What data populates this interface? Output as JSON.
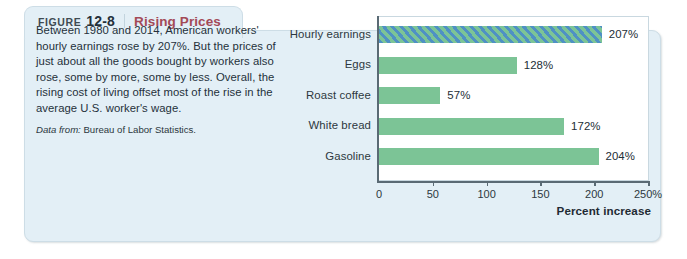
{
  "figure": {
    "label_word": "FIGURE",
    "number": "12-8",
    "title": "Rising Prices"
  },
  "caption": {
    "body": "Between 1980 and 2014, American workers' hourly earnings rose by 207%. But the prices of just about all the goods bought by workers also rose, some by more, some by less. Overall, the rising cost of living offset most of the rise in the average U.S. worker's wage.",
    "source_prefix": "Data from:",
    "source_text": "Bureau of Labor Statistics."
  },
  "colors": {
    "panel_background": "#e3eff6",
    "panel_border": "#cddde6",
    "title_red": "#a34a57",
    "bar_green": "#7cc496",
    "hatch_blue": "#4f91c4",
    "axis": "#5a6a74",
    "plot_background": "#ffffff"
  },
  "chart_data": {
    "type": "bar",
    "orientation": "horizontal",
    "title": "Rising Prices",
    "xlabel": "Percent increase",
    "ylabel": "",
    "xlim": [
      0,
      250
    ],
    "grid": false,
    "legend": null,
    "categories": [
      "Hourly earnings",
      "Eggs",
      "Roast coffee",
      "White bread",
      "Gasoline"
    ],
    "values": [
      207,
      128,
      57,
      172,
      204
    ],
    "value_labels": [
      "207%",
      "128%",
      "57%",
      "172%",
      "204%"
    ],
    "bar_styles": [
      "hatched",
      "solid",
      "solid",
      "solid",
      "solid"
    ],
    "xticks": [
      0,
      50,
      100,
      150,
      200,
      250
    ],
    "xtick_labels": [
      "0",
      "50",
      "100",
      "150",
      "200",
      "250%"
    ]
  }
}
